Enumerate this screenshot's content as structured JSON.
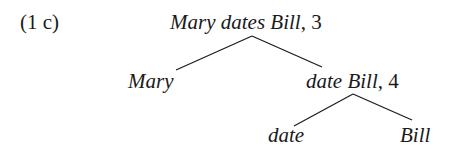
{
  "example_label": "(1 c)",
  "tree": {
    "root": {
      "expr": "Mary dates Bill",
      "rule": "3"
    },
    "left": {
      "expr": "Mary"
    },
    "right": {
      "expr": "date Bill",
      "rule": "4",
      "left": {
        "expr": "date"
      },
      "right": {
        "expr": "Bill"
      }
    }
  },
  "parts": {
    "root_w1": "Mary",
    "root_w2": "dates",
    "root_w3": "Bill",
    "root_rule": ", 3",
    "left_leaf": "Mary",
    "mid_w1": "date",
    "mid_w2": "Bill",
    "mid_rule": ", 4",
    "leaf_date": "date",
    "leaf_bill": "Bill"
  },
  "colors": {
    "text": "#1a1a1a",
    "lines": "#1a1a1a",
    "background": "#ffffff"
  }
}
